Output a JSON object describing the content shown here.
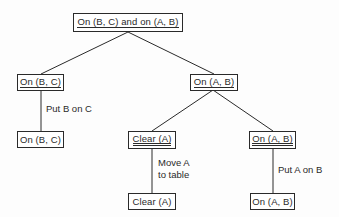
{
  "diagram": {
    "type": "goal-tree",
    "nodes": [
      {
        "id": "root",
        "label": "On (B, C) and on (A, B)",
        "underline": "single"
      },
      {
        "id": "left",
        "label": "On (B, C)",
        "underline": "single"
      },
      {
        "id": "right",
        "label": "On (A, B)",
        "underline": "single"
      },
      {
        "id": "left_leaf",
        "label": "On (B, C)",
        "underline": "none"
      },
      {
        "id": "clear_goal",
        "label": "Clear (A)",
        "underline": "double"
      },
      {
        "id": "on_goal",
        "label": "On (A, B)",
        "underline": "double"
      },
      {
        "id": "clear_leaf",
        "label": "Clear (A)",
        "underline": "none"
      },
      {
        "id": "on_leaf",
        "label": "On (A, B)",
        "underline": "none"
      }
    ],
    "edge_labels": {
      "put_b_on_c": "Put B on C",
      "move_a_line1": "Move A",
      "move_a_line2": "to table",
      "put_a_on_b": "Put A on B"
    },
    "edges": [
      {
        "from": "root",
        "to": "left"
      },
      {
        "from": "root",
        "to": "right"
      },
      {
        "from": "left",
        "to": "left_leaf",
        "label": "Put B on C"
      },
      {
        "from": "right",
        "to": "clear_goal"
      },
      {
        "from": "right",
        "to": "on_goal"
      },
      {
        "from": "clear_goal",
        "to": "clear_leaf",
        "label": "Move A to table"
      },
      {
        "from": "on_goal",
        "to": "on_leaf",
        "label": "Put A on B"
      }
    ]
  }
}
